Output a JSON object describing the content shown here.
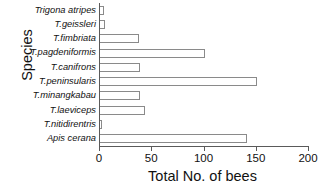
{
  "chart_data": {
    "type": "bar",
    "orientation": "horizontal",
    "title": "",
    "xlabel": "Total No. of bees",
    "ylabel": "Species",
    "xlim": [
      0,
      200
    ],
    "xticks": [
      0,
      50,
      100,
      150,
      200
    ],
    "xticklabels": [
      "0",
      "50",
      "100",
      "150",
      "200"
    ],
    "grid": false,
    "legend": null,
    "bar_style": {
      "fill": "#ffffff",
      "edge": "#8a8a8a"
    },
    "axis_color": "#5a5a5a",
    "categories": [
      "Trigona atripes",
      "T.geissleri",
      "T.fimbriata",
      "T.pagdeniformis",
      "T.canifrons",
      "T.peninsularis",
      "T.minangkabau",
      "T.laeviceps",
      "T.nitidirentris",
      "Apis cerana"
    ],
    "values": [
      4,
      5,
      37,
      100,
      38,
      150,
      38,
      43,
      1,
      141
    ]
  }
}
